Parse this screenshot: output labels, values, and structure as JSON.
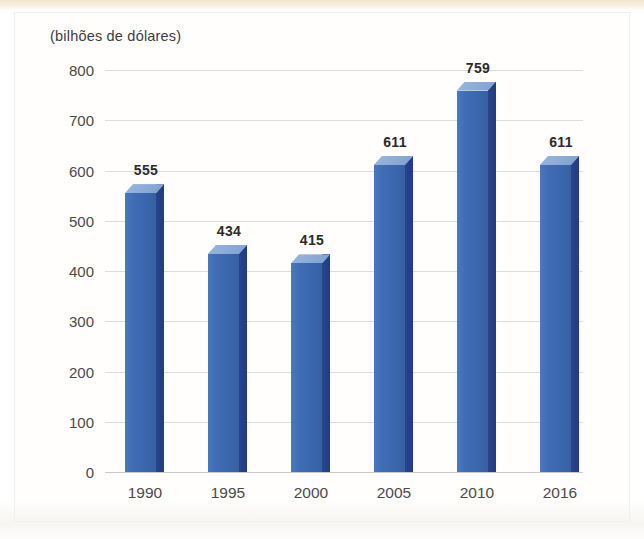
{
  "chart_data": {
    "type": "bar",
    "title": "",
    "subtitle": "(bilhões de dólares)",
    "categories": [
      "1990",
      "1995",
      "2000",
      "2005",
      "2010",
      "2016"
    ],
    "values": [
      555,
      434,
      415,
      611,
      759,
      611
    ],
    "value_labels": [
      "555",
      "434",
      "415",
      "611",
      "759",
      "611"
    ],
    "xlabel": "",
    "ylabel": "",
    "ylim": [
      0,
      800
    ],
    "ytick_labels": [
      "800",
      "700",
      "600",
      "500",
      "400",
      "300",
      "200",
      "100",
      "0"
    ],
    "ytick_values": [
      800,
      700,
      600,
      500,
      400,
      300,
      200,
      100,
      0
    ],
    "grid": true,
    "legend": null,
    "style": "3d-column",
    "colors": {
      "bar_front": "#3f6cb4",
      "bar_side": "#23408c",
      "bar_top": "#8aa9d6",
      "gridline": "#dcdcdc",
      "axis_text": "#4a4a4a",
      "value_text": "#2b2b2b",
      "page_strip": "#f3e7cf",
      "background": "#ffffff"
    }
  },
  "credit": {
    "text": "Ericson Guilherme Luciano/Arquivo da editora"
  }
}
